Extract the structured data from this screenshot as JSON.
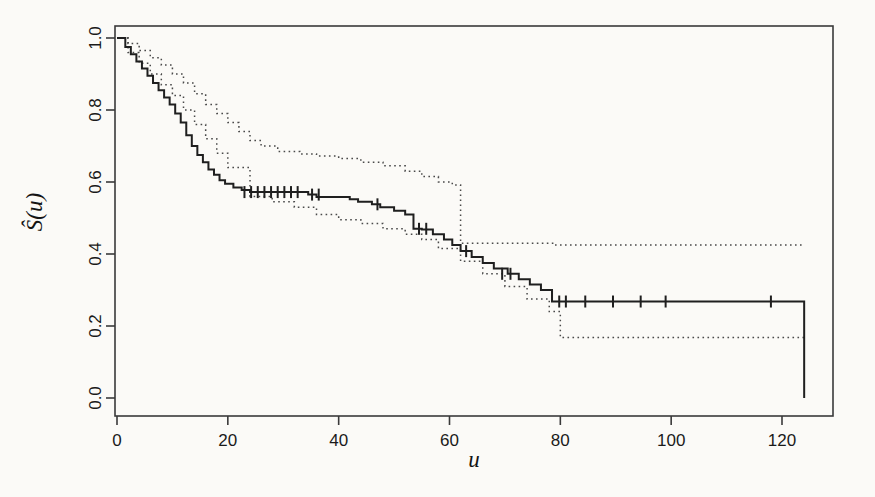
{
  "figure": {
    "background_color": "#fbfaf7",
    "ink_color": "#1f1f1f"
  },
  "chart_data": {
    "type": "line",
    "title": "",
    "subtitle": "",
    "xlabel": "u",
    "ylabel": "Ŝ(u)",
    "xlim": [
      0,
      129
    ],
    "ylim": [
      0.0,
      1.04
    ],
    "xticks": [
      0,
      20,
      40,
      60,
      80,
      100,
      120
    ],
    "xticklabels": [
      "0",
      "20",
      "40",
      "60",
      "80",
      "100",
      "120"
    ],
    "yticks": [
      0.0,
      0.2,
      0.4,
      0.6,
      0.8,
      1.0
    ],
    "yticklabels": [
      "0.0",
      "0.2",
      "0.4",
      "0.6",
      "0.8",
      "1.0"
    ],
    "grid": false,
    "legend": null,
    "plot_frame": true,
    "annotations": [],
    "series": [
      {
        "name": "Kaplan-Meier estimate",
        "style": "step-solid",
        "x": [
          0,
          1.5,
          2.5,
          3.5,
          4.5,
          5.5,
          6.5,
          7.5,
          8.5,
          9.5,
          10.5,
          11.5,
          12.5,
          13.5,
          14.5,
          15.5,
          16.5,
          17.5,
          18.5,
          19.5,
          21.0,
          22.5,
          24.0,
          33.0,
          34.5,
          36.0,
          42.0,
          43.5,
          46.0,
          47.5,
          50.0,
          52.0,
          53.5,
          55.0,
          57.0,
          59.0,
          60.5,
          62.0,
          64.0,
          66.0,
          68.0,
          70.5,
          72.5,
          74.5,
          76.5,
          78.5,
          124.0
        ],
        "y": [
          1.0,
          0.975,
          0.955,
          0.935,
          0.915,
          0.895,
          0.875,
          0.855,
          0.835,
          0.815,
          0.79,
          0.765,
          0.73,
          0.7,
          0.675,
          0.655,
          0.635,
          0.62,
          0.605,
          0.595,
          0.585,
          0.578,
          0.572,
          0.572,
          0.565,
          0.558,
          0.552,
          0.545,
          0.538,
          0.53,
          0.52,
          0.51,
          0.47,
          0.468,
          0.455,
          0.44,
          0.425,
          0.408,
          0.392,
          0.375,
          0.36,
          0.345,
          0.33,
          0.315,
          0.3,
          0.268,
          0.268
        ],
        "drop_to_zero_at": 124.0
      },
      {
        "name": "Upper 95% confidence band",
        "style": "step-dotted",
        "x": [
          0,
          2.0,
          4.0,
          6.0,
          8.0,
          10.0,
          12.0,
          14.0,
          16.0,
          18.0,
          20.0,
          22.0,
          24.0,
          26.0,
          29.0,
          33.0,
          36.0,
          40.0,
          44.0,
          48.0,
          52.0,
          55.0,
          58.0,
          60.5,
          62.0,
          79.0,
          124.0
        ],
        "y": [
          1.0,
          0.985,
          0.965,
          0.945,
          0.925,
          0.9,
          0.875,
          0.845,
          0.815,
          0.79,
          0.765,
          0.74,
          0.715,
          0.7,
          0.685,
          0.678,
          0.672,
          0.665,
          0.655,
          0.645,
          0.63,
          0.615,
          0.6,
          0.592,
          0.43,
          0.425,
          0.425
        ]
      },
      {
        "name": "Lower 95% confidence band",
        "style": "step-dotted",
        "x": [
          0,
          2.0,
          4.0,
          6.0,
          8.0,
          10.0,
          12.0,
          14.0,
          16.0,
          18.0,
          20.0,
          24.0,
          28.0,
          32.0,
          36.0,
          40.0,
          44.0,
          48.0,
          52.0,
          55.0,
          58.0,
          62.0,
          66.0,
          70.0,
          74.0,
          78.0,
          80.0,
          124.0
        ],
        "y": [
          1.0,
          0.96,
          0.93,
          0.9,
          0.87,
          0.84,
          0.8,
          0.76,
          0.72,
          0.68,
          0.64,
          0.56,
          0.545,
          0.53,
          0.51,
          0.495,
          0.485,
          0.47,
          0.455,
          0.44,
          0.415,
          0.38,
          0.345,
          0.31,
          0.275,
          0.24,
          0.168,
          0.168
        ]
      }
    ],
    "censor_marks": [
      {
        "x": 23.0,
        "y": 0.572
      },
      {
        "x": 24.2,
        "y": 0.572
      },
      {
        "x": 25.4,
        "y": 0.572
      },
      {
        "x": 26.6,
        "y": 0.572
      },
      {
        "x": 27.8,
        "y": 0.572
      },
      {
        "x": 29.0,
        "y": 0.572
      },
      {
        "x": 30.2,
        "y": 0.572
      },
      {
        "x": 31.4,
        "y": 0.572
      },
      {
        "x": 32.6,
        "y": 0.572
      },
      {
        "x": 35.2,
        "y": 0.565
      },
      {
        "x": 36.4,
        "y": 0.565
      },
      {
        "x": 47.0,
        "y": 0.538
      },
      {
        "x": 54.5,
        "y": 0.47
      },
      {
        "x": 55.8,
        "y": 0.47
      },
      {
        "x": 63.0,
        "y": 0.408
      },
      {
        "x": 69.5,
        "y": 0.345
      },
      {
        "x": 71.0,
        "y": 0.345
      },
      {
        "x": 79.8,
        "y": 0.268
      },
      {
        "x": 81.0,
        "y": 0.268
      },
      {
        "x": 84.5,
        "y": 0.268
      },
      {
        "x": 89.5,
        "y": 0.268
      },
      {
        "x": 94.5,
        "y": 0.268
      },
      {
        "x": 99.0,
        "y": 0.268
      },
      {
        "x": 118.0,
        "y": 0.268
      }
    ]
  }
}
